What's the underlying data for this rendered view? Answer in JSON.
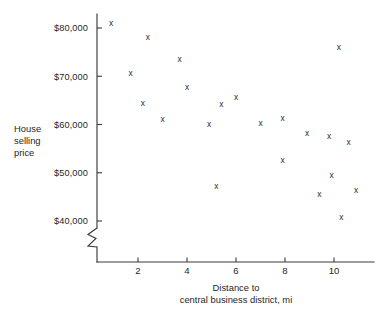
{
  "figure": {
    "background_color": "#ffffff",
    "ink_color": "#2b2b2b",
    "width": 377,
    "height": 314
  },
  "axes": {
    "y_axis_label_lines": [
      "House",
      "selling",
      "price"
    ],
    "x_axis_label_lines": [
      "Distance to",
      "central business district, mi"
    ],
    "y_ticks": [
      {
        "value": 40000,
        "label": "$40,000"
      },
      {
        "value": 50000,
        "label": "$50,000"
      },
      {
        "value": 60000,
        "label": "$60,000"
      },
      {
        "value": 70000,
        "label": "$70,000"
      },
      {
        "value": 80000,
        "label": "$80,000"
      }
    ],
    "x_ticks": [
      {
        "value": 2,
        "label": "2"
      },
      {
        "value": 4,
        "label": "4"
      },
      {
        "value": 6,
        "label": "6"
      },
      {
        "value": 8,
        "label": "8"
      },
      {
        "value": 10,
        "label": "10"
      }
    ],
    "y_axis_break": true,
    "grid": false
  },
  "chart_data": {
    "type": "scatter",
    "title": "",
    "xlabel": "Distance to central business district, mi",
    "ylabel": "House selling price",
    "xlim": [
      0,
      11.6
    ],
    "ylim": [
      38000,
      82500
    ],
    "grid": false,
    "legend": null,
    "marker": "x",
    "points": [
      {
        "x": 0.9,
        "y": 80800
      },
      {
        "x": 1.7,
        "y": 70500
      },
      {
        "x": 2.2,
        "y": 64300
      },
      {
        "x": 2.4,
        "y": 77900
      },
      {
        "x": 3.0,
        "y": 61000
      },
      {
        "x": 3.7,
        "y": 73500
      },
      {
        "x": 4.0,
        "y": 67600
      },
      {
        "x": 4.9,
        "y": 60000
      },
      {
        "x": 5.2,
        "y": 47000
      },
      {
        "x": 5.4,
        "y": 64000
      },
      {
        "x": 6.0,
        "y": 65600
      },
      {
        "x": 7.0,
        "y": 60200
      },
      {
        "x": 7.9,
        "y": 61200
      },
      {
        "x": 7.9,
        "y": 52500
      },
      {
        "x": 8.9,
        "y": 58000
      },
      {
        "x": 9.4,
        "y": 45400
      },
      {
        "x": 9.8,
        "y": 57500
      },
      {
        "x": 9.9,
        "y": 49400
      },
      {
        "x": 10.2,
        "y": 75800
      },
      {
        "x": 10.3,
        "y": 40600
      },
      {
        "x": 10.6,
        "y": 56200
      },
      {
        "x": 10.9,
        "y": 46200
      }
    ]
  }
}
